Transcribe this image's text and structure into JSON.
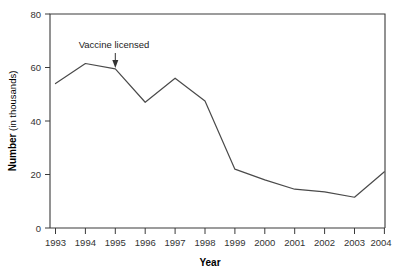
{
  "chart_data": {
    "type": "line",
    "title": "",
    "xlabel": "Year",
    "ylabel": "Number (in thousands)",
    "ylabel_bold_part": "Number",
    "ylabel_regular_part": "(in thousands)",
    "categories": [
      "1993",
      "1994",
      "1995",
      "1996",
      "1997",
      "1998",
      "1999",
      "2000",
      "2001",
      "2002",
      "2003",
      "2004"
    ],
    "x": [
      1993,
      1994,
      1995,
      1996,
      1997,
      1998,
      1999,
      2000,
      2001,
      2002,
      2003,
      2004
    ],
    "values": [
      54,
      61.5,
      59.5,
      47,
      56,
      47.5,
      22,
      18,
      14.5,
      13.5,
      11.5,
      21
    ],
    "series": [
      {
        "name": "Number (in thousands)",
        "values": [
          54,
          61.5,
          59.5,
          47,
          56,
          47.5,
          22,
          18,
          14.5,
          13.5,
          11.5,
          21
        ]
      }
    ],
    "xlim": [
      1993,
      2004
    ],
    "ylim": [
      0,
      80
    ],
    "ytick_labels": [
      "0",
      "20",
      "40",
      "60",
      "80"
    ],
    "ytick_values": [
      0,
      20,
      40,
      60,
      80
    ],
    "xtick_labels": [
      "1993",
      "1994",
      "1995",
      "1996",
      "1997",
      "1998",
      "1999",
      "2000",
      "2001",
      "2002",
      "2003",
      "2004"
    ],
    "grid": false,
    "legend": false,
    "legend_position": "none",
    "line_color": "#4a4a4a",
    "axis_color": "#3a3a3a",
    "annotations": [
      {
        "text": "Vaccine licensed",
        "at_x": 1995,
        "at_y": 59.5,
        "arrow": "down"
      }
    ]
  },
  "axes": {
    "x_title": "Year",
    "y_title_bold": "Number",
    "y_title_rest": " (in thousands)"
  },
  "annotation": {
    "label": "Vaccine licensed"
  }
}
